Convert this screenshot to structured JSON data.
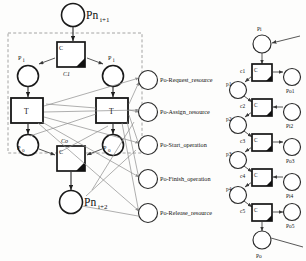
{
  "figure": {
    "background": "#fdfdfc",
    "stroke": "#1a1a1a",
    "arc_color": "#3a3a3a",
    "faint_arc_color": "#8d8d8d",
    "dash_color": "#8e8e8e"
  },
  "left_net": {
    "top_place": {
      "label": "Pn",
      "sub": "i+1"
    },
    "bottom_place": {
      "label": "Pn",
      "sub": "i+2"
    },
    "top_control": {
      "label": "C",
      "name": "C1",
      "sub": "1"
    },
    "bottom_control": {
      "label": "C",
      "name": "Co",
      "sub": "o"
    },
    "places": [
      {
        "id": "pi-left",
        "label": "P",
        "sub": "i"
      },
      {
        "id": "pi-right",
        "label": "P",
        "sub": "i"
      },
      {
        "id": "po-left",
        "label": "P",
        "sub": "o"
      },
      {
        "id": "po-right",
        "label": "P",
        "sub": "o"
      }
    ],
    "transitions": [
      {
        "id": "t-left",
        "label": "T"
      },
      {
        "id": "t-right",
        "label": "T"
      }
    ]
  },
  "operation_places": [
    {
      "id": "op-request",
      "label": "Po-Request_resource"
    },
    {
      "id": "op-assign",
      "label": "Po-Assign_resource"
    },
    {
      "id": "op-start",
      "label": "Po-Start_operation"
    },
    {
      "id": "op-finish",
      "label": "Po-Finish_operation"
    },
    {
      "id": "op-release",
      "label": "Po-Release_resource"
    }
  ],
  "right_net": {
    "top_place": {
      "label": "Pi"
    },
    "bottom_place": {
      "label": "Po"
    },
    "controllers": [
      {
        "id": "c1",
        "label": "C",
        "name": "c1"
      },
      {
        "id": "c2",
        "label": "C",
        "name": "c2"
      },
      {
        "id": "c3",
        "label": "C",
        "name": "c3"
      },
      {
        "id": "c4",
        "label": "C",
        "name": "c4"
      },
      {
        "id": "c5",
        "label": "C",
        "name": "c5"
      }
    ],
    "left_places": [
      {
        "id": "p1",
        "label": "p1"
      },
      {
        "id": "p2",
        "label": "p2"
      },
      {
        "id": "p3",
        "label": "p3"
      },
      {
        "id": "p4",
        "label": "p4"
      }
    ],
    "right_places": [
      {
        "id": "po1",
        "label": "Po1"
      },
      {
        "id": "pi2",
        "label": "Pi2"
      },
      {
        "id": "po3",
        "label": "Po3"
      },
      {
        "id": "pi4",
        "label": "Pi4"
      },
      {
        "id": "po5",
        "label": "Po5"
      }
    ]
  }
}
